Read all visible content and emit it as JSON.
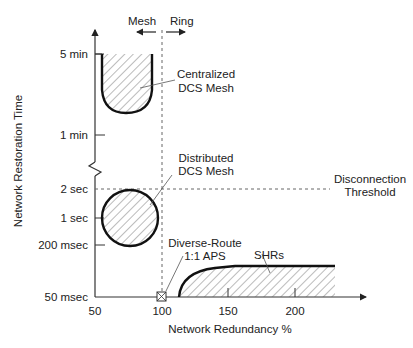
{
  "diagram": {
    "y_axis_label": "Network Restoration Time",
    "x_axis_label": "Network Redundancy %",
    "y_ticks": [
      "5 min",
      "1 min",
      "2 sec",
      "1 sec",
      "200 msec",
      "50 msec"
    ],
    "x_ticks": [
      "50",
      "100",
      "150",
      "200"
    ],
    "direction_labels": {
      "mesh": "Mesh",
      "ring": "Ring"
    },
    "regions": {
      "centralized": [
        "Centralized",
        "DCS Mesh"
      ],
      "distributed": [
        "Distributed",
        "DCS Mesh"
      ],
      "diverse_route": [
        "Diverse-Route",
        "1:1 APS"
      ],
      "shrs": "SHRs"
    },
    "threshold": [
      "Disconnection",
      "Threshold"
    ]
  }
}
